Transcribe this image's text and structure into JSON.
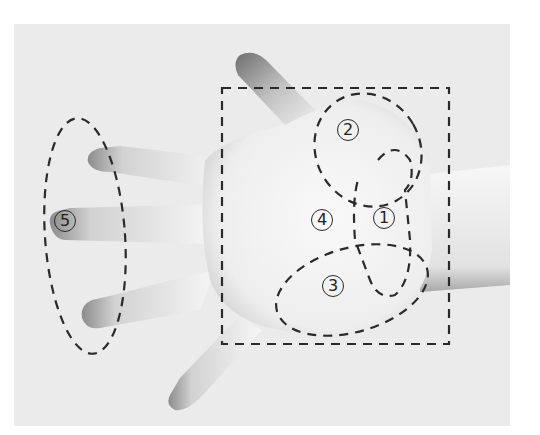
{
  "figure": {
    "labels": [
      {
        "id": "1",
        "text": "1",
        "x": 384,
        "y": 218
      },
      {
        "id": "2",
        "text": "2",
        "x": 348,
        "y": 130
      },
      {
        "id": "3",
        "text": "3",
        "x": 333,
        "y": 286
      },
      {
        "id": "4",
        "text": "4",
        "x": 322,
        "y": 220
      },
      {
        "id": "5",
        "text": "5",
        "x": 65,
        "y": 221
      }
    ],
    "colors": {
      "background": "#ebebeb",
      "skin_light": "#f4f4f4",
      "skin_shadow": "#9a9a9a",
      "dash_line": "#2a2a2a"
    }
  }
}
